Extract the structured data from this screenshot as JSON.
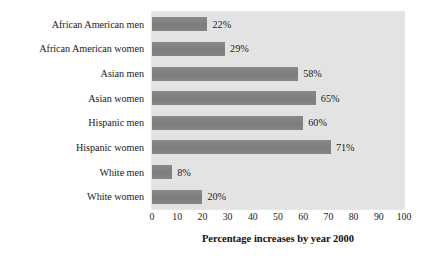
{
  "chart_data": {
    "type": "bar",
    "orientation": "horizontal",
    "title": "",
    "xlabel": "Percentage increases by year 2000",
    "ylabel": "",
    "categories": [
      "African American men",
      "African American women",
      "Asian men",
      "Asian women",
      "Hispanic men",
      "Hispanic women",
      "White men",
      "White women"
    ],
    "values": [
      22,
      29,
      58,
      65,
      60,
      71,
      8,
      20
    ],
    "value_labels": [
      "22%",
      "29%",
      "58%",
      "65%",
      "60%",
      "71%",
      "8%",
      "20%"
    ],
    "xlim": [
      0,
      100
    ],
    "xticks": [
      0,
      10,
      20,
      30,
      40,
      50,
      60,
      70,
      80,
      90,
      100
    ],
    "xtick_labels": [
      "0",
      "10",
      "20",
      "30",
      "40",
      "50",
      "60",
      "70",
      "80",
      "90",
      "100"
    ],
    "grid": false,
    "legend": false,
    "bar_color": "#818181",
    "plot_background": "#e3e3e3",
    "page_background": "#ffffff",
    "text_color": "#1b1b1b"
  }
}
